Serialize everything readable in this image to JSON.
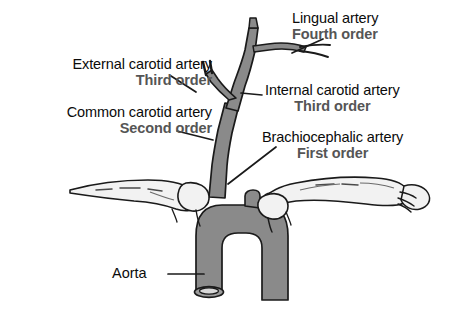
{
  "figure": {
    "background_color": "#ffffff",
    "vessel_fill_color": "#8a8a8a",
    "vessel_outline_color": "#1a1a1a",
    "bone_fill_color": "#f2f2f2",
    "order_text_color": "#555555",
    "artery_text_color": "#0b0b0b"
  },
  "labels": {
    "lingual": {
      "artery": "Lingual artery",
      "order": "Fourth order"
    },
    "external_carotid": {
      "artery": "External carotid artery",
      "order": "Third order"
    },
    "common_carotid": {
      "artery": "Common carotid artery",
      "order": "Second order"
    },
    "internal_carotid": {
      "artery": "Internal carotid artery",
      "order": "Third order"
    },
    "brachiocephalic": {
      "artery": "Brachiocephalic artery",
      "order": "First order"
    },
    "aorta": {
      "artery": "Aorta"
    }
  }
}
